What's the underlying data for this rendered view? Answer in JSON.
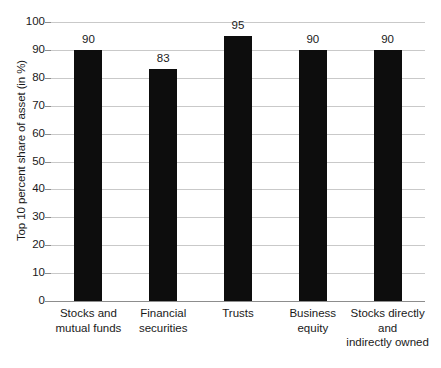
{
  "chart_data": {
    "type": "bar",
    "title": "",
    "xlabel": "",
    "ylabel": "Top 10 percent share of asset (in %)",
    "categories": [
      "Stocks and mutual funds",
      "Financial securities",
      "Trusts",
      "Business equity",
      "Stocks directly and indirectly owned"
    ],
    "category_lines": [
      [
        "Stocks and",
        "mutual funds"
      ],
      [
        "Financial",
        "securities"
      ],
      [
        "Trusts"
      ],
      [
        "Business",
        "equity"
      ],
      [
        "Stocks directly",
        "and",
        "indirectly owned"
      ]
    ],
    "values": [
      90,
      83,
      95,
      90,
      90
    ],
    "value_labels": [
      "90",
      "83",
      "95",
      "90",
      "90"
    ],
    "ylim": [
      0,
      100
    ],
    "ytick_labels": [
      "0",
      "10",
      "20",
      "30",
      "40",
      "50",
      "60",
      "70",
      "80",
      "90",
      "100"
    ],
    "ytick_values": [
      0,
      10,
      20,
      30,
      40,
      50,
      60,
      70,
      80,
      90,
      100
    ],
    "grid": true,
    "legend": "none",
    "colors": {
      "bar": "#0d0d0d",
      "gridline": "#c9c9c9",
      "axis": "#8d8d8d",
      "text": "#1a1a1a",
      "background": "#ffffff"
    }
  }
}
